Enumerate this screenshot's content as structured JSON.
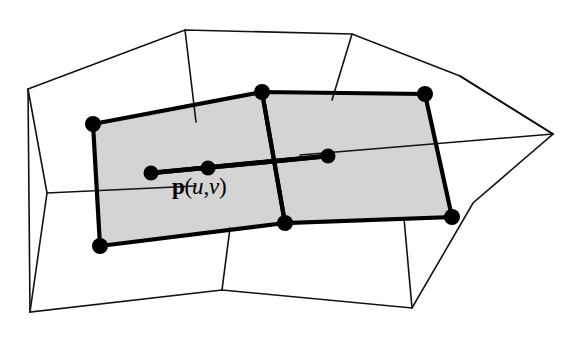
{
  "figure": {
    "background_color": "#ffffff",
    "width": 576,
    "height": 348,
    "label": {
      "full_text": "p(u,v)",
      "symbol": "p",
      "open_paren": "(",
      "param_u": "u",
      "comma": ",",
      "param_v": "v",
      "close_paren": ")",
      "x": 172,
      "y": 175
    },
    "colors": {
      "patch_fill": "#d4d4d4",
      "stroke": "#000000",
      "mesh_stroke": "#111111"
    },
    "mesh": {
      "outer_boundary": "M 28,89 L 185,30 L 352,34 L 460,76 L 553,134 L 473,203 L 412,308 L 222,290 L 30,312 Z",
      "interior_edges": [
        "M 185,30 L 196,122",
        "M 352,34 L 332,100",
        "M 553,134 L 300,155",
        "M 28,89 L 47,193 L 196,186",
        "M 47,193 L 30,312",
        "M 222,290 L 230,228",
        "M 412,308 L 404,218",
        "M 460,76 L 553,134"
      ]
    },
    "patches": [
      {
        "name": "left-patch",
        "outline": "M 93,124 L 262,92 L 285,223 L 100,246 Z",
        "vertices": [
          {
            "x": 93,
            "y": 124
          },
          {
            "x": 262,
            "y": 92
          },
          {
            "x": 285,
            "y": 223
          },
          {
            "x": 100,
            "y": 246
          }
        ]
      },
      {
        "name": "right-patch",
        "outline": "M 262,92 L 425,94 L 452,217 L 285,223 Z",
        "vertices": [
          {
            "x": 262,
            "y": 92
          },
          {
            "x": 425,
            "y": 94
          },
          {
            "x": 452,
            "y": 217
          },
          {
            "x": 285,
            "y": 223
          }
        ]
      }
    ],
    "parameter_line": {
      "start": {
        "x": 151,
        "y": 173
      },
      "mid": {
        "x": 208,
        "y": 168
      },
      "end": {
        "x": 328,
        "y": 156
      },
      "dot_radius": 7.5
    },
    "patch_vertex_dot_radius": 8.0
  }
}
